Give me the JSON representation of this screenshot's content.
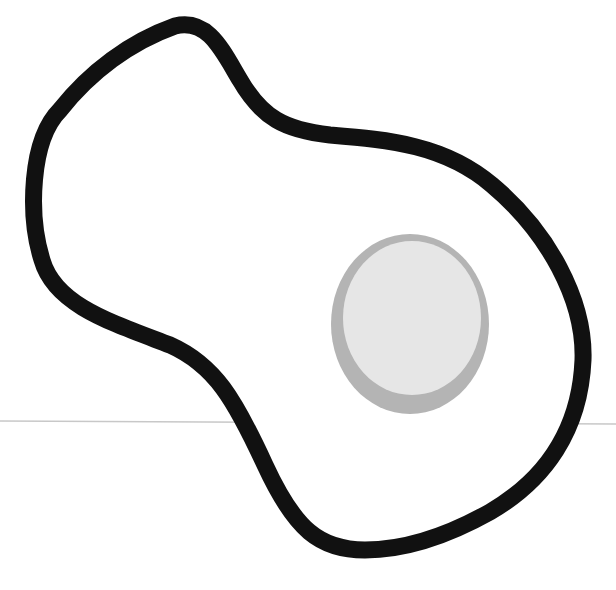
{
  "illustration": {
    "subject": "fried egg",
    "background_color": "#ffffff",
    "horizon_line": {
      "y": 422,
      "color": "#c8c8c8"
    },
    "egg_white": {
      "fill": "#ffffff",
      "outline_color": "#111111"
    },
    "yolk": {
      "fill": "#e6e6e6",
      "rim_color": "#b4b4b4",
      "cx": 410,
      "cy": 322,
      "rx": 78,
      "ry": 90
    }
  }
}
